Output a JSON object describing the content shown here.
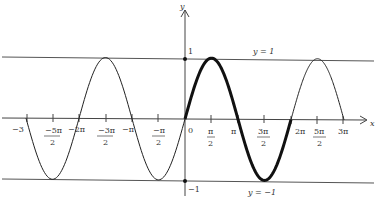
{
  "figure": {
    "axis_labels": {
      "x": "x",
      "y": "y"
    },
    "y_ticks": {
      "top": "1",
      "bottom": "−1"
    },
    "bound_lines": {
      "upper": "y = 1",
      "lower": "y = −1"
    },
    "x_ticks": [
      {
        "num": "−3",
        "den": ""
      },
      {
        "num": "−5π",
        "den": "2"
      },
      {
        "num": "−2π",
        "den": ""
      },
      {
        "num": "−3π",
        "den": "2"
      },
      {
        "num": "−π",
        "den": ""
      },
      {
        "num": "−π",
        "den": "2"
      },
      {
        "num": "0",
        "den": ""
      },
      {
        "num": "π",
        "den": "2"
      },
      {
        "num": "π",
        "den": ""
      },
      {
        "num": "3π",
        "den": "2"
      },
      {
        "num": "2π",
        "den": ""
      },
      {
        "num": "5π",
        "den": "2"
      },
      {
        "num": "3π",
        "den": ""
      }
    ],
    "highlighted_period": "0 to 2π",
    "colors": {
      "curve": "#111111",
      "lines": "#444444"
    }
  }
}
